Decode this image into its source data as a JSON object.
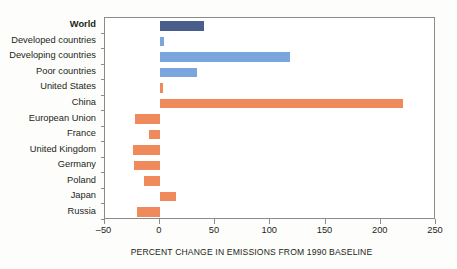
{
  "chart_data": {
    "type": "bar",
    "orientation": "horizontal",
    "title": "",
    "xlabel": "PERCENT CHANGE IN EMISSIONS FROM 1990 BASELINE",
    "ylabel": "",
    "xlim": [
      -50,
      250
    ],
    "xticks": [
      -50,
      0,
      50,
      100,
      150,
      200,
      250
    ],
    "xtick_labels": [
      "–50",
      "0",
      "50",
      "100",
      "150",
      "200",
      "250"
    ],
    "grid": false,
    "legend": "none",
    "categories": [
      "World",
      "Developed countries",
      "Developing countries",
      "Poor countries",
      "United States",
      "China",
      "European Union",
      "France",
      "United Kingdom",
      "Germany",
      "Poland",
      "Japan",
      "Russia"
    ],
    "values": [
      40,
      4,
      118,
      34,
      3,
      220,
      -22,
      -10,
      -24,
      -23,
      -14,
      15,
      -21
    ],
    "bar_colors": [
      "#4a5e8c",
      "#7aa6dd",
      "#7aa6dd",
      "#7aa6dd",
      "#ef8a5c",
      "#ef8a5c",
      "#ef8a5c",
      "#ef8a5c",
      "#ef8a5c",
      "#ef8a5c",
      "#ef8a5c",
      "#ef8a5c",
      "#ef8a5c"
    ],
    "emphasis_category": "World"
  },
  "colors": {
    "world": "#4a5e8c",
    "aggregate": "#7aa6dd",
    "country": "#ef8a5c",
    "axis": "#8b8b8b",
    "text": "#231f20",
    "background": "#ffffff"
  }
}
